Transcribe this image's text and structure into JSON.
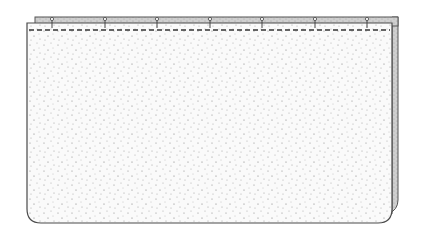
{
  "diagram": {
    "colors": {
      "background": "#ffffff",
      "outline": "#555555",
      "band_fill": "#c8c8c8",
      "back_panel_fill": "#bdbdbd",
      "front_fill": "#fafafa",
      "stipple": "#8a8a8a",
      "stitch": "#333333"
    },
    "back_band": {
      "x": 35,
      "y": 17,
      "width": 363,
      "height": 9
    },
    "back_panel_edge": {
      "x": 392,
      "y": 17,
      "width": 7,
      "height": 196
    },
    "front_panel": {
      "x": 27,
      "y": 23,
      "width": 365,
      "height": 200,
      "corner_radius": 14
    },
    "stitch_line": {
      "y": 30,
      "x1": 29,
      "x2": 390,
      "dash": "5 3"
    },
    "pins": [
      52,
      105,
      157,
      210,
      262,
      315,
      367
    ],
    "labels": []
  }
}
